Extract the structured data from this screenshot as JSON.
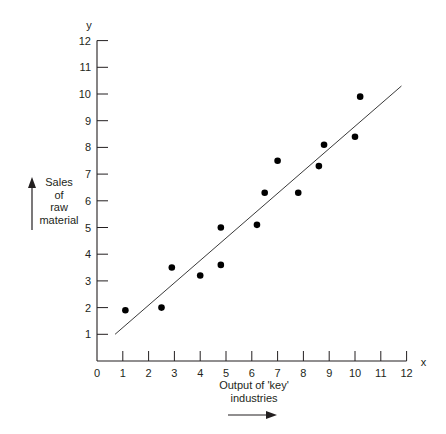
{
  "chart_data": {
    "type": "scatter",
    "title": "",
    "xlabel": "Output of 'key' industries",
    "ylabel": "Sales of raw material",
    "x_axis_letter": "x",
    "y_axis_letter": "y",
    "xlim": [
      0,
      12
    ],
    "ylim": [
      0,
      12
    ],
    "x_ticks": [
      0,
      1,
      2,
      3,
      4,
      5,
      6,
      7,
      8,
      9,
      10,
      11,
      12
    ],
    "y_ticks": [
      1,
      2,
      3,
      4,
      5,
      6,
      7,
      8,
      9,
      10,
      11,
      12
    ],
    "grid": false,
    "legend": null,
    "series": [
      {
        "name": "observations",
        "points": [
          {
            "x": 1.1,
            "y": 1.9
          },
          {
            "x": 2.5,
            "y": 2.0
          },
          {
            "x": 2.9,
            "y": 3.5
          },
          {
            "x": 4.0,
            "y": 3.2
          },
          {
            "x": 4.8,
            "y": 5.0
          },
          {
            "x": 4.8,
            "y": 3.6
          },
          {
            "x": 6.2,
            "y": 5.1
          },
          {
            "x": 6.5,
            "y": 6.3
          },
          {
            "x": 7.0,
            "y": 7.5
          },
          {
            "x": 7.8,
            "y": 6.3
          },
          {
            "x": 8.6,
            "y": 7.3
          },
          {
            "x": 8.8,
            "y": 8.1
          },
          {
            "x": 10.0,
            "y": 8.4
          },
          {
            "x": 10.2,
            "y": 9.9
          }
        ]
      }
    ],
    "trend_line": {
      "x1": 0.7,
      "y1": 1.0,
      "x2": 11.8,
      "y2": 10.3
    }
  },
  "labels": {
    "ylabel_lines": [
      "Sales",
      "of",
      "raw",
      "material"
    ],
    "xlabel_lines": [
      "Output of 'key'",
      "industries"
    ]
  }
}
